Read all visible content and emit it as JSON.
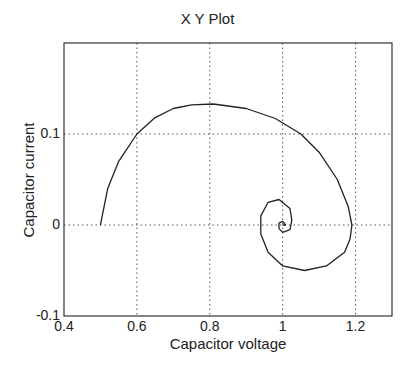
{
  "chart_data": {
    "type": "line",
    "title": "X Y Plot",
    "xlabel": "Capacitor voltage",
    "ylabel": "Capacitor current",
    "xlim": [
      0.4,
      1.3
    ],
    "ylim": [
      -0.1,
      0.2
    ],
    "xticks": [
      0.4,
      0.6,
      0.8,
      1,
      1.2
    ],
    "xtick_labels": [
      "0.4",
      "0.6",
      "0.8",
      "1",
      "1.2"
    ],
    "yticks": [
      -0.1,
      0,
      0.1
    ],
    "ytick_labels": [
      "-0.1",
      "0",
      "0.1"
    ],
    "grid": true,
    "legend": null,
    "series": [
      {
        "name": "phase trajectory",
        "color": "#222222",
        "x": [
          0.5,
          0.52,
          0.55,
          0.6,
          0.65,
          0.7,
          0.75,
          0.81,
          0.9,
          0.98,
          1.05,
          1.1,
          1.15,
          1.18,
          1.19,
          1.185,
          1.17,
          1.12,
          1.06,
          1.0,
          0.96,
          0.94,
          0.94,
          0.96,
          0.99,
          1.02,
          1.025,
          1.02,
          1.0,
          0.99,
          0.99,
          1.0,
          1.008,
          1.0
        ],
        "y": [
          0.0,
          0.04,
          0.07,
          0.1,
          0.118,
          0.128,
          0.132,
          0.133,
          0.128,
          0.117,
          0.1,
          0.08,
          0.05,
          0.02,
          0.0,
          -0.015,
          -0.03,
          -0.045,
          -0.05,
          -0.045,
          -0.03,
          -0.01,
          0.01,
          0.025,
          0.028,
          0.018,
          0.005,
          -0.005,
          -0.008,
          -0.004,
          0.002,
          0.004,
          0.0,
          0.0
        ]
      }
    ]
  }
}
